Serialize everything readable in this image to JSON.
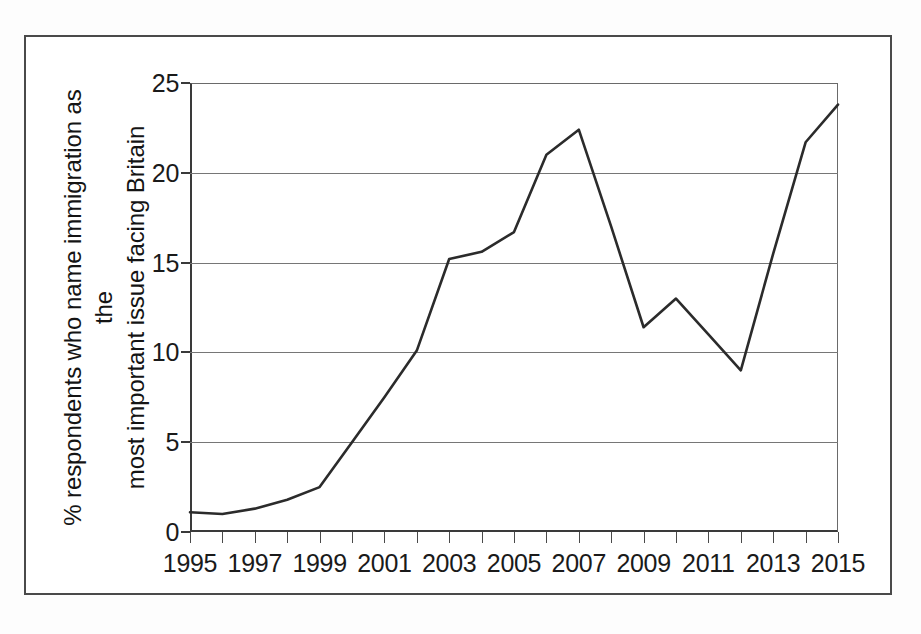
{
  "figure": {
    "background_color": "#fdfdfd",
    "frame_color": "#4a4a4a",
    "has_outer_border": true
  },
  "axes": {
    "y_label_line1": "% respondents who name immigration as the",
    "y_label_line2": "most important issue facing Britain",
    "y_ticks": [
      "0",
      "5",
      "10",
      "15",
      "20",
      "25"
    ],
    "x_ticks_labeled": [
      "1995",
      "1997",
      "1999",
      "2001",
      "2003",
      "2005",
      "2007",
      "2009",
      "2011",
      "2013",
      "2015"
    ],
    "gridline_color": "#767676",
    "line_color": "#2b2b2b"
  },
  "chart_data": {
    "type": "line",
    "title": "",
    "subtitle": "",
    "xlabel": "",
    "ylabel": "% respondents who name immigration as the most important issue facing Britain",
    "xlim": [
      1995,
      2015
    ],
    "ylim": [
      0,
      25
    ],
    "xticks": [
      1995,
      1996,
      1997,
      1998,
      1999,
      2000,
      2001,
      2002,
      2003,
      2004,
      2005,
      2006,
      2007,
      2008,
      2009,
      2010,
      2011,
      2012,
      2013,
      2014,
      2015
    ],
    "xtick_labels_shown": [
      1995,
      1997,
      1999,
      2001,
      2003,
      2005,
      2007,
      2009,
      2011,
      2013,
      2015
    ],
    "yticks": [
      0,
      5,
      10,
      15,
      20,
      25
    ],
    "grid": "horizontal",
    "legend": "none",
    "annotations": [],
    "series": [
      {
        "name": "Immigration named most important issue facing Britain (%)",
        "color": "#2b2b2b",
        "x": [
          1995,
          1996,
          1997,
          1998,
          1999,
          2000,
          2001,
          2002,
          2003,
          2004,
          2005,
          2006,
          2007,
          2008,
          2009,
          2010,
          2011,
          2012,
          2013,
          2014,
          2015
        ],
        "values": [
          1.1,
          1.0,
          1.3,
          1.8,
          2.5,
          5.0,
          7.5,
          10.1,
          15.2,
          15.6,
          16.7,
          21.0,
          22.4,
          17.0,
          11.4,
          13.0,
          11.0,
          9.0,
          15.5,
          21.7,
          23.8
        ]
      }
    ]
  }
}
